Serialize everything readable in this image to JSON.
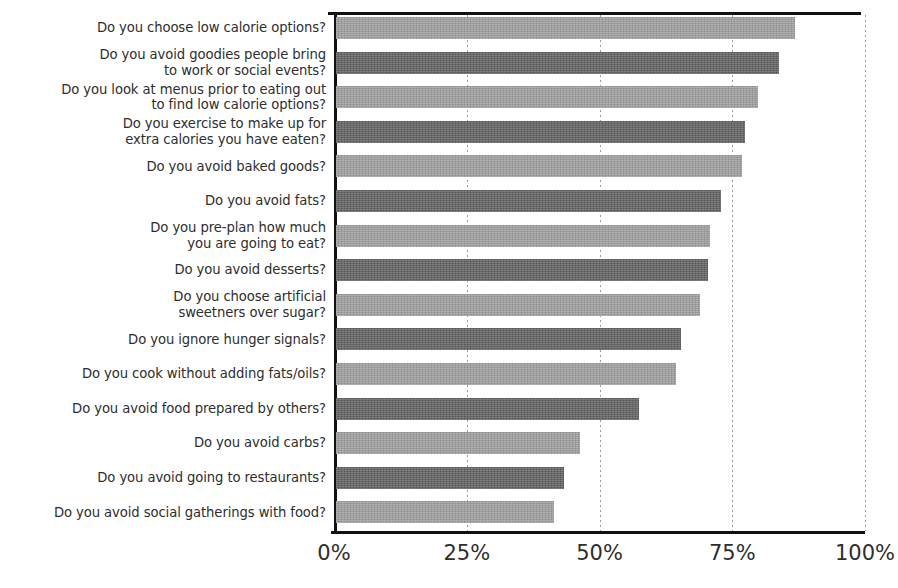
{
  "chart_data": {
    "type": "bar",
    "orientation": "horizontal",
    "title": "",
    "xlabel": "",
    "ylabel": "",
    "xlim": [
      0,
      100
    ],
    "xticks": [
      "0%",
      "25%",
      "50%",
      "75%",
      "100%"
    ],
    "xtick_values": [
      0,
      25,
      50,
      75,
      100
    ],
    "grid": "vertical-dotted",
    "legend": "none",
    "value_format": "percent",
    "colors": {
      "bar_light": "#a0a0a0",
      "bar_dark": "#636363",
      "axis": "#111111",
      "gridline": "#9b9b9b",
      "text": "#2e2e2e",
      "background": "#ffffff"
    },
    "categories": [
      "Do you choose low calorie options?",
      "Do you avoid goodies people bring\nto work or social events?",
      "Do you look at menus prior to eating out\nto find low calorie options?",
      "Do you exercise to make up for\nextra calories you have eaten?",
      "Do you avoid baked goods?",
      "Do you avoid fats?",
      "Do you pre-plan how much\nyou are going to eat?",
      "Do you avoid desserts?",
      "Do you choose artificial\nsweetners over sugar?",
      "Do you ignore hunger signals?",
      "Do you cook without adding fats/oils?",
      "Do you avoid food prepared by others?",
      "Do you avoid carbs?",
      "Do you avoid going to restaurants?",
      "Do you avoid social gatherings with food?"
    ],
    "values": [
      86.5,
      83.5,
      79.5,
      77,
      76.5,
      72.5,
      70.5,
      70,
      68.5,
      65,
      64,
      57,
      46,
      43,
      41
    ]
  }
}
